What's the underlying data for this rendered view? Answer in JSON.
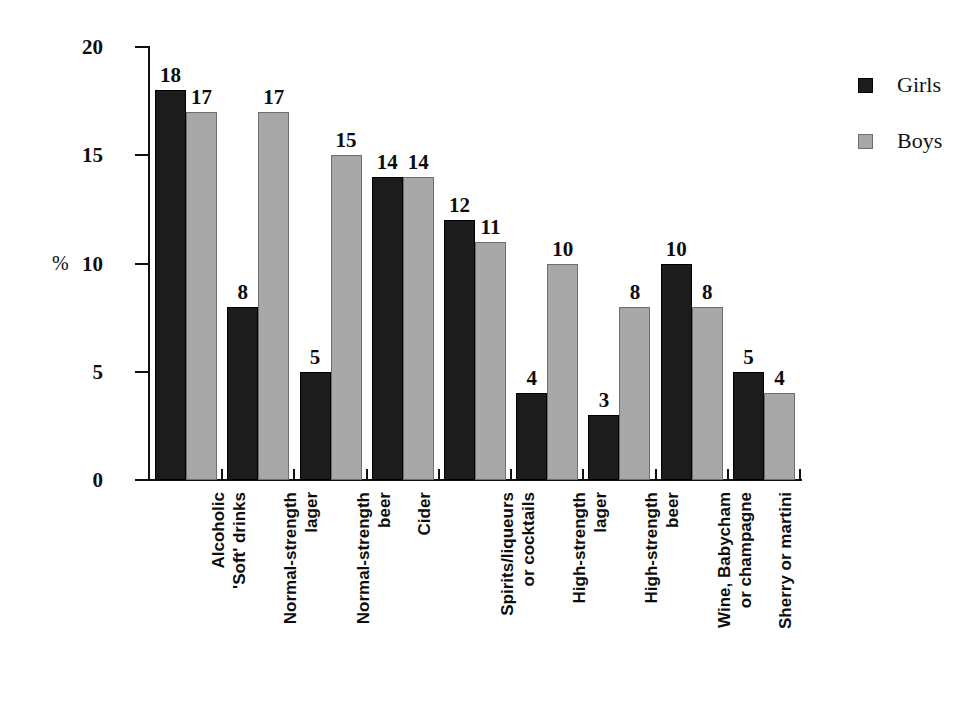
{
  "chart_data": {
    "type": "bar",
    "title": "",
    "xlabel": "",
    "ylabel": "%",
    "ylim": [
      0,
      20
    ],
    "yticks": [
      0,
      5,
      10,
      15,
      20
    ],
    "ytick_labels": [
      "0",
      "5",
      "10",
      "15",
      "20"
    ],
    "grid": false,
    "legend_position": "right",
    "categories": [
      "Alcoholic 'Soft' drinks",
      "Normal-strength lager",
      "Normal-strength beer",
      "Cider",
      "Spirits/liqueurs or cocktails",
      "High-strength lager",
      "High-strength beer",
      "Wine, Babycham or champagne",
      "Sherry or martini"
    ],
    "category_lines": [
      [
        "Alcoholic",
        "'Soft' drinks"
      ],
      [
        "Normal-strength",
        "lager"
      ],
      [
        "Normal-strength",
        "beer"
      ],
      [
        "Cider"
      ],
      [
        "Spirits/liqueurs",
        "or cocktails"
      ],
      [
        "High-strength",
        "lager"
      ],
      [
        "High-strength",
        "beer"
      ],
      [
        "Wine, Babycham",
        "or champagne"
      ],
      [
        "Sherry or martini"
      ]
    ],
    "series": [
      {
        "name": "Girls",
        "color": "#1c1c1c",
        "values": [
          18,
          8,
          5,
          14,
          12,
          4,
          3,
          10,
          5
        ]
      },
      {
        "name": "Boys",
        "color": "#a8a8a8",
        "values": [
          17,
          17,
          15,
          14,
          11,
          10,
          8,
          8,
          4
        ]
      }
    ]
  },
  "axis": {
    "y_label": "%"
  },
  "legend": {
    "items": [
      {
        "label": "Girls",
        "color": "#1c1c1c"
      },
      {
        "label": "Boys",
        "color": "#a8a8a8"
      }
    ]
  }
}
